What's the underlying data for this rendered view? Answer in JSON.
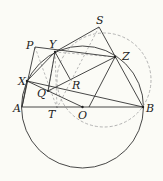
{
  "diagram": {
    "type": "geometry",
    "labels": {
      "P": "P",
      "Y": "Y",
      "S": "S",
      "Z": "Z",
      "X": "X",
      "Q": "Q",
      "R": "R",
      "A": "A",
      "T": "T",
      "O": "O",
      "B": "B"
    },
    "colors": {
      "line": "#333333",
      "dashed": "#aaaaaa",
      "background": "#fbfbf6"
    }
  }
}
